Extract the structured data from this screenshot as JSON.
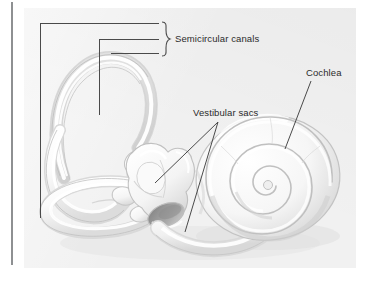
{
  "figure": {
    "style": "pencil-shaded anatomical drawing of the bony labyrinth",
    "background_color": "#ffffff",
    "panel_color": "#f1f1f1",
    "line_color": "#4a4a4a",
    "text_color": "#2b2b2b",
    "rule_color": "#8e9092"
  },
  "labels": {
    "semicircular_canals": "Semicircular canals",
    "vestibular_sacs": "Vestibular sacs",
    "cochlea": "Cochlea"
  },
  "annotations": {
    "semicircular_canals": {
      "leader_count": 3,
      "has_brace": true,
      "brace_side": "left"
    },
    "vestibular_sacs": {
      "leader_count": 2,
      "has_brace": false
    },
    "cochlea": {
      "leader_count": 1,
      "has_brace": false
    }
  },
  "structures": [
    {
      "name": "anterior-semicircular-canal",
      "region": "upper-left"
    },
    {
      "name": "posterior-semicircular-canal",
      "region": "left"
    },
    {
      "name": "lateral-semicircular-canal",
      "region": "lower-left"
    },
    {
      "name": "vestibule-utricle",
      "region": "center"
    },
    {
      "name": "saccule",
      "region": "center-lower"
    },
    {
      "name": "oval-window",
      "region": "center-lower"
    },
    {
      "name": "cochlea-spiral",
      "region": "right",
      "turns": 2.5
    }
  ]
}
